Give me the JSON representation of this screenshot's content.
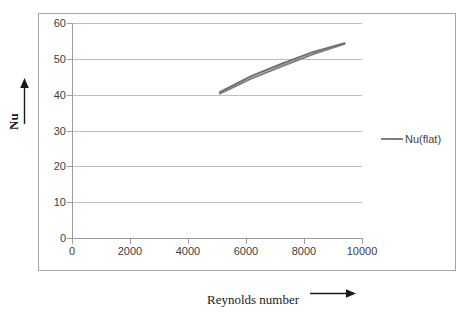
{
  "chart_data": {
    "type": "line",
    "title": "",
    "xlabel": "Reynolds number",
    "ylabel": "Nu",
    "xlim": [
      0,
      10000
    ],
    "ylim": [
      0,
      60
    ],
    "xticks": [
      0,
      2000,
      4000,
      6000,
      8000,
      10000
    ],
    "yticks": [
      0,
      10,
      20,
      30,
      40,
      50,
      60
    ],
    "xtick_labels": [
      "0",
      "2000",
      "4000",
      "6000",
      "8000",
      "10000"
    ],
    "ytick_labels": [
      "0",
      "10",
      "20",
      "30",
      "40",
      "50",
      "60"
    ],
    "grid": "horizontal",
    "legend_position": "right",
    "legend": [
      "Nu(flat)"
    ],
    "series": [
      {
        "name": "Nu(flat)",
        "color": "#808080",
        "x": [
          5100,
          6200,
          7300,
          8300,
          9400
        ],
        "values": [
          40.4,
          44.6,
          48.2,
          51.3,
          54.2
        ]
      },
      {
        "name": "Nu(flat) 2",
        "color": "#707070",
        "x": [
          5100,
          6200,
          7300,
          8300,
          9400
        ],
        "values": [
          40.8,
          45.3,
          48.9,
          51.9,
          54.4
        ]
      }
    ]
  },
  "axes": {
    "y_title": "Nu",
    "x_title": "Reynolds number",
    "y_arrow_icon": "up-arrow-icon",
    "x_arrow_icon": "right-arrow-icon"
  },
  "legend": {
    "entries": [
      {
        "label": "Nu(flat)",
        "color": "#808080"
      }
    ]
  },
  "colors": {
    "frame_border": "#a6a6a6",
    "gridline": "#bfbfbf",
    "axis_line": "#9c9c9c",
    "tick_text": "#404040",
    "title_text": "#1a1a1a",
    "series_primary": "#808080",
    "series_secondary": "#707070",
    "background": "#ffffff"
  }
}
